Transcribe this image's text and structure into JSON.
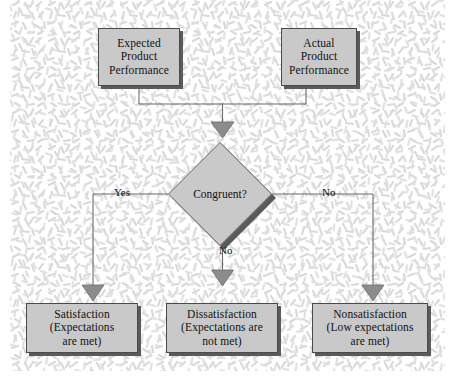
{
  "diagram": {
    "colors": {
      "node_fill": "#c9c9c9",
      "node_border": "#4a4a4a",
      "shadow": "#5a5a5a",
      "connector": "#6b6b6b",
      "arrowhead": "#8c8c8c",
      "text": "#111111",
      "background": "#ffffff",
      "texture_stroke": "#d8d8d8"
    },
    "inputs": [
      {
        "id": "expected-product-performance",
        "lines": [
          "Expected",
          "Product",
          "Performance"
        ]
      },
      {
        "id": "actual-product-performance",
        "lines": [
          "Actual",
          "Product",
          "Performance"
        ]
      }
    ],
    "decision": {
      "id": "congruent-decision",
      "label": "Congruent?"
    },
    "edge_labels": {
      "left": "Yes",
      "center": "No",
      "right": "No"
    },
    "outcomes": [
      {
        "id": "satisfaction",
        "lines": [
          "Satisfaction",
          "(Expectations",
          "are met)"
        ]
      },
      {
        "id": "dissatisfaction",
        "lines": [
          "Dissatisfaction",
          "(Expectations are",
          "not met)"
        ]
      },
      {
        "id": "nonsatisfaction",
        "lines": [
          "Nonsatisfaction",
          "(Low expectations",
          "are met)"
        ]
      }
    ]
  }
}
